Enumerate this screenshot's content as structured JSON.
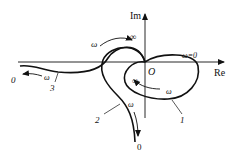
{
  "figure": {
    "type": "nyquist-plot",
    "axes": {
      "real_label": "Re",
      "imag_label": "Im",
      "origin_label": "O"
    },
    "annotations": {
      "omega_zero": "ω=0",
      "infinity_top": "∞",
      "infinity_inner": "∞",
      "omega_top": "ω",
      "omega_curve1": "ω",
      "omega_curve2": "ω",
      "omega_curve3": "ω",
      "zero_left": "0",
      "zero_bottom": "0"
    },
    "curves": [
      {
        "id": "1",
        "label": "1"
      },
      {
        "id": "2",
        "label": "2"
      },
      {
        "id": "3",
        "label": "3"
      }
    ],
    "colors": {
      "stroke": "#111111",
      "background": "#ffffff"
    }
  }
}
